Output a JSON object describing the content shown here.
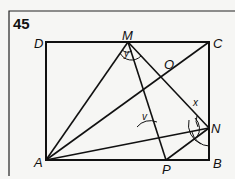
{
  "figure": {
    "number": "45",
    "labels": {
      "D": "D",
      "M": "M",
      "C": "C",
      "O": "O",
      "N": "N",
      "A": "A",
      "P": "P",
      "B": "B"
    },
    "angles": {
      "y": "y",
      "v": "v",
      "x": "x"
    },
    "points": {
      "D": [
        46,
        42
      ],
      "C": [
        209,
        42
      ],
      "B": [
        209,
        160
      ],
      "A": [
        46,
        160
      ],
      "M": [
        128,
        42
      ],
      "N": [
        209,
        128
      ],
      "P": [
        166,
        160
      ],
      "O": [
        163,
        73
      ]
    },
    "segments": [
      [
        "A",
        "M"
      ],
      [
        "A",
        "C"
      ],
      [
        "A",
        "N"
      ],
      [
        "M",
        "N"
      ],
      [
        "M",
        "P"
      ],
      [
        "N",
        "P"
      ]
    ],
    "colors": {
      "line": "#111111",
      "background": "#f6f6f4"
    }
  }
}
